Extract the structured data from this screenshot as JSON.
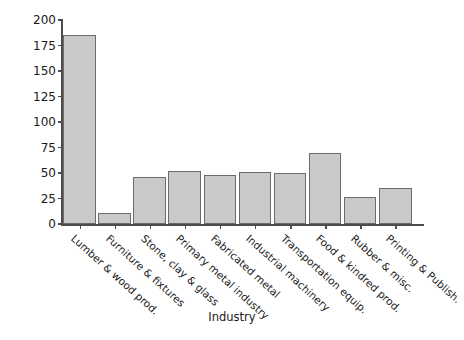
{
  "chart_data": {
    "type": "bar",
    "title": "",
    "xlabel": "Industry",
    "ylabel": "Fatalities in 2000",
    "ylim": [
      0,
      200
    ],
    "yticks": [
      0,
      25,
      50,
      75,
      100,
      125,
      150,
      175,
      200
    ],
    "grid": false,
    "legend": null,
    "bar_color": "#c9c9c9",
    "bar_edge_color": "#6b6b6b",
    "axis_color": "#4d4d4d",
    "categories": [
      "Lumber & wood prod.",
      "Furniture & fixtures",
      "Stone, clay & glass",
      "Primary metal industry",
      "Fabricated metal",
      "Industrial machinery",
      "Transportation equip.",
      "Food & kindred prod.",
      "Rubber & misc.",
      "Printing & Publish."
    ],
    "values": [
      185,
      11,
      46,
      52,
      48,
      51,
      50,
      70,
      26,
      35
    ]
  }
}
